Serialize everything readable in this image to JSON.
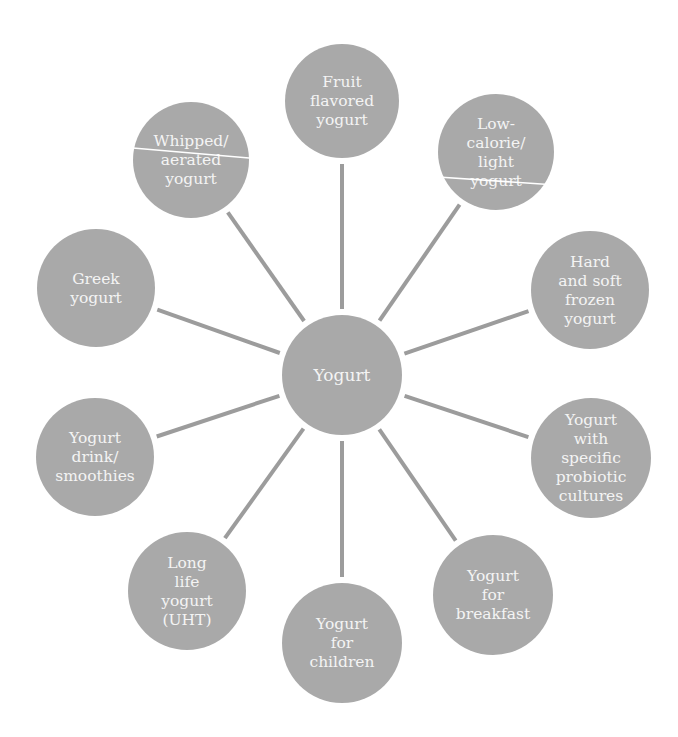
{
  "diagram": {
    "type": "hub-and-spoke",
    "colors": {
      "node_fill": "#a9a9a9",
      "spoke": "#9c9c9c",
      "text": "#f4f4f4",
      "divider": "#ffffff",
      "background": "#ffffff"
    },
    "center": {
      "id": "yogurt",
      "lines": [
        "Yogurt"
      ],
      "cx": 342,
      "cy": 375,
      "r": 60
    },
    "nodes": [
      {
        "id": "fruit-flavored",
        "lines": [
          "Fruit",
          "flavored",
          "yogurt"
        ],
        "cx": 342,
        "cy": 101,
        "r": 57
      },
      {
        "id": "low-calorie",
        "lines": [
          "Low-",
          "calorie/",
          "light",
          "yogurt"
        ],
        "cx": 496,
        "cy": 152,
        "r": 58,
        "divider": {
          "x1": 438,
          "y1": 177,
          "x2": 556,
          "y2": 185
        }
      },
      {
        "id": "frozen",
        "lines": [
          "Hard",
          "and soft",
          "frozen",
          "yogurt"
        ],
        "cx": 590,
        "cy": 290,
        "r": 59
      },
      {
        "id": "probiotic",
        "lines": [
          "Yogurt",
          "with",
          "specific",
          "probiotic",
          "cultures"
        ],
        "cx": 591,
        "cy": 458,
        "r": 60
      },
      {
        "id": "breakfast",
        "lines": [
          "Yogurt",
          "for",
          "breakfast"
        ],
        "cx": 493,
        "cy": 595,
        "r": 60
      },
      {
        "id": "children",
        "lines": [
          "Yogurt",
          "for",
          "children"
        ],
        "cx": 342,
        "cy": 643,
        "r": 60
      },
      {
        "id": "long-life",
        "lines": [
          "Long",
          "life",
          "yogurt",
          "(UHT)"
        ],
        "cx": 187,
        "cy": 591,
        "r": 59
      },
      {
        "id": "smoothies",
        "lines": [
          "Yogurt",
          "drink/",
          "smoothies"
        ],
        "cx": 95,
        "cy": 457,
        "r": 59
      },
      {
        "id": "greek",
        "lines": [
          "Greek",
          "yogurt"
        ],
        "cx": 96,
        "cy": 288,
        "r": 59
      },
      {
        "id": "whipped",
        "lines": [
          "Whipped/",
          "aerated",
          "yogurt"
        ],
        "cx": 191,
        "cy": 160,
        "r": 58,
        "divider": {
          "x1": 133,
          "y1": 148,
          "x2": 249,
          "y2": 158
        }
      }
    ]
  }
}
